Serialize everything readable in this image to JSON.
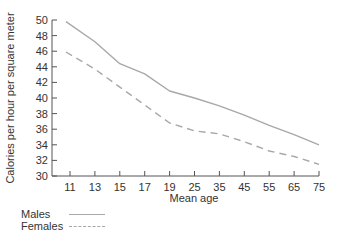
{
  "chart_data": {
    "type": "line",
    "title": "",
    "xlabel": "Mean age",
    "ylabel": "Calories per hour per square meter",
    "categories": [
      "11",
      "13",
      "15",
      "17",
      "19",
      "25",
      "35",
      "45",
      "55",
      "65",
      "75"
    ],
    "series": [
      {
        "name": "Males",
        "style": "solid",
        "values": [
          49.8,
          47.2,
          44.4,
          43.1,
          40.9,
          40.0,
          39.0,
          37.8,
          36.5,
          35.3,
          34.0
        ]
      },
      {
        "name": "Females",
        "style": "dashed",
        "values": [
          45.9,
          43.7,
          41.4,
          39.1,
          36.8,
          35.8,
          35.4,
          34.4,
          33.2,
          32.5,
          31.5
        ]
      }
    ],
    "ylim": [
      30,
      50
    ],
    "yticks": [
      30,
      32,
      34,
      36,
      38,
      40,
      42,
      44,
      46,
      48,
      50
    ],
    "grid": false,
    "legend_position": "bottom-left"
  },
  "legend": {
    "males": "Males",
    "females": "Females"
  },
  "colors": {
    "line": "#a8a8a8",
    "axis": "#555555",
    "text": "#333333"
  }
}
